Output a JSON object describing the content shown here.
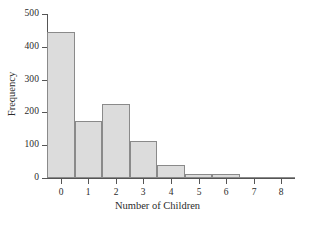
{
  "chart_data": {
    "type": "bar",
    "title": "",
    "xlabel": "Number of Children",
    "ylabel": "Frequency",
    "categories": [
      "0",
      "1",
      "2",
      "3",
      "4",
      "5",
      "6",
      "7",
      "8"
    ],
    "values": [
      445,
      175,
      225,
      113,
      40,
      11,
      11,
      0,
      3
    ],
    "xlim": [
      -0.5,
      8.5
    ],
    "ylim": [
      0,
      500
    ],
    "ytick_labels": [
      "0",
      "100",
      "200",
      "300",
      "400",
      "500"
    ],
    "ytick_values": [
      0,
      100,
      200,
      300,
      400,
      500
    ],
    "xtick_labels": [
      "0",
      "1",
      "2",
      "3",
      "4",
      "5",
      "6",
      "7",
      "8"
    ],
    "grid": false,
    "legend": false,
    "bar_fill": "#dcdcdc",
    "bar_edge": "#8a8a8a",
    "axis_color": "#555555",
    "text_color": "#2b2b2b",
    "background": "#ffffff"
  }
}
